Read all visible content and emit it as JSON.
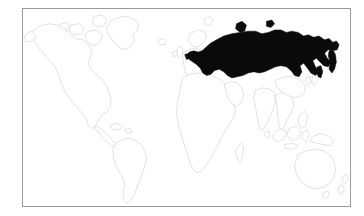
{
  "figure": {
    "type": "locator-map",
    "title": "",
    "caption": "",
    "background_color": "#ffffff"
  },
  "frame": {
    "border_color": "#9a9a9a",
    "fill_color": "#ffffff",
    "x": 22,
    "y": 8,
    "width": 329,
    "height": 199
  },
  "map": {
    "projection": "equirectangular",
    "lon_range": [
      -180,
      180
    ],
    "lat_range": [
      -60,
      84
    ],
    "land_outline_color": "#c9c9c9",
    "land_fill_color": "#ffffff",
    "highlight_color": "#0a0a0a",
    "highlighted_regions": [
      {
        "name": "Russia",
        "label": "Russia",
        "color": "#0a0a0a"
      }
    ],
    "visible_landmasses": [
      "North America",
      "Greenland",
      "South America",
      "Europe",
      "Africa",
      "Asia",
      "Russia",
      "India",
      "Southeast Asia",
      "Indonesia",
      "Australia",
      "New Zealand",
      "Japan",
      "Madagascar",
      "United Kingdom",
      "Iceland",
      "Papua New Guinea",
      "Sri Lanka",
      "Philippines",
      "Cuba",
      "Borneo",
      "Sumatra",
      "New Guinea",
      "Svalbard",
      "Novaya Zemlya",
      "Sakhalin",
      "Kamchatka",
      "Tasmania"
    ]
  },
  "chart_data": {
    "type": "map",
    "title": "",
    "xlabel": "",
    "ylabel": "",
    "categories": [
      "Russia",
      "Rest of world"
    ],
    "values": [
      1,
      0
    ],
    "legend": [],
    "grid": false
  }
}
